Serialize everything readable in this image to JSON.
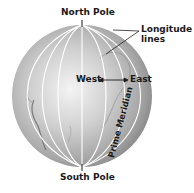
{
  "diagram": {
    "labels": {
      "north_pole": "North Pole",
      "south_pole": "South Pole",
      "longitude_line1": "Longitude",
      "longitude_line2": "lines",
      "west": "West",
      "east": "East",
      "prime_meridian": "Prime Meridian"
    },
    "colors": {
      "globe_light": "#f2f2f2",
      "globe_mid": "#b5b5b5",
      "globe_dark": "#7a7a7a",
      "meridian_line": "#ffffff",
      "label_text": "#1a1a1a"
    }
  }
}
